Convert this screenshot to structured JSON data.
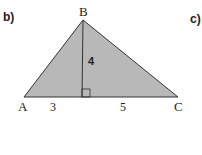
{
  "part_labels": {
    "left": "b)",
    "right": "c)"
  },
  "triangle": {
    "vertices": {
      "A": "A",
      "B": "B",
      "C": "C"
    },
    "segments": {
      "left_base": "3",
      "right_base": "5",
      "altitude": "4"
    },
    "fill_color": "#b8b8b8",
    "stroke_color": "#333333"
  }
}
